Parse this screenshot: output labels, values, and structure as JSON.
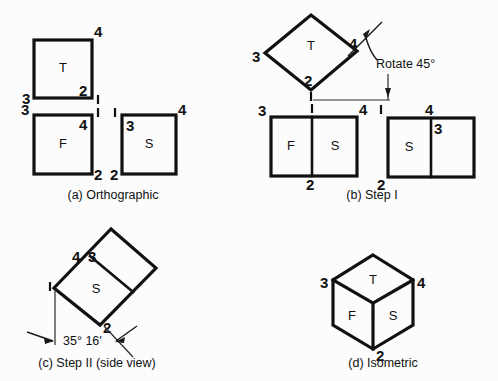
{
  "figure": {
    "background_color": "#fcfcfc",
    "line_color": "#111111",
    "panels": [
      {
        "id": "a",
        "caption": "(a) Orthographic",
        "face_labels": [
          "T",
          "F",
          "S"
        ],
        "vertex_labels": [
          "4",
          "3",
          "2",
          "1",
          "3",
          "1",
          "4",
          "2",
          "1",
          "3",
          "4",
          "2"
        ]
      },
      {
        "id": "b",
        "caption": "(b) Step I",
        "annotation": "Rotate 45°",
        "face_labels": [
          "T",
          "F",
          "S",
          "S"
        ],
        "vertex_labels": [
          "3",
          "4",
          "2",
          "1",
          "3",
          "1",
          "4",
          "2",
          "1",
          "4",
          "3",
          "2"
        ]
      },
      {
        "id": "c",
        "caption": "(c) Step II (side view)",
        "annotation": "35° 16′",
        "face_labels": [
          "S"
        ],
        "vertex_labels": [
          "4",
          "3",
          "1",
          "2"
        ]
      },
      {
        "id": "d",
        "caption": "(d) Isometric",
        "face_labels": [
          "T",
          "F",
          "S"
        ],
        "vertex_labels": [
          "3",
          "4",
          "2",
          "1"
        ]
      }
    ]
  },
  "panel_a": {
    "caption": "(a) Orthographic",
    "top_view": {
      "face": "T",
      "label_4": "4",
      "label_3": "3",
      "label_2": "2",
      "label_1": "1"
    },
    "front_view": {
      "face": "F",
      "label_3": "3",
      "label_4": "4",
      "label_2": "2",
      "label_1": "1"
    },
    "side_view": {
      "face": "S",
      "label_1": "1",
      "label_3": "3",
      "label_4": "4",
      "label_2": "2"
    }
  },
  "panel_b": {
    "caption": "(b) Step I",
    "annotation": "Rotate 45°",
    "top_view": {
      "face": "T",
      "label_3": "3",
      "label_4": "4",
      "label_2": "2",
      "label_1": "1"
    },
    "front_view": {
      "face_left": "F",
      "face_right": "S",
      "label_3": "3",
      "label_1": "1",
      "label_4": "4",
      "label_2": "2"
    },
    "side_view": {
      "face": "S",
      "label_1": "1",
      "label_4": "4",
      "label_3": "3",
      "label_2": "2"
    }
  },
  "panel_c": {
    "caption": "(c) Step II (side view)",
    "annotation": "35° 16′",
    "face": "S",
    "label_4": "4",
    "label_3": "3",
    "label_1": "1",
    "label_2": "2"
  },
  "panel_d": {
    "caption": "(d) Isometric",
    "face_top": "T",
    "face_front": "F",
    "face_side": "S",
    "label_3": "3",
    "label_4": "4",
    "label_2": "2",
    "label_1": "1"
  }
}
